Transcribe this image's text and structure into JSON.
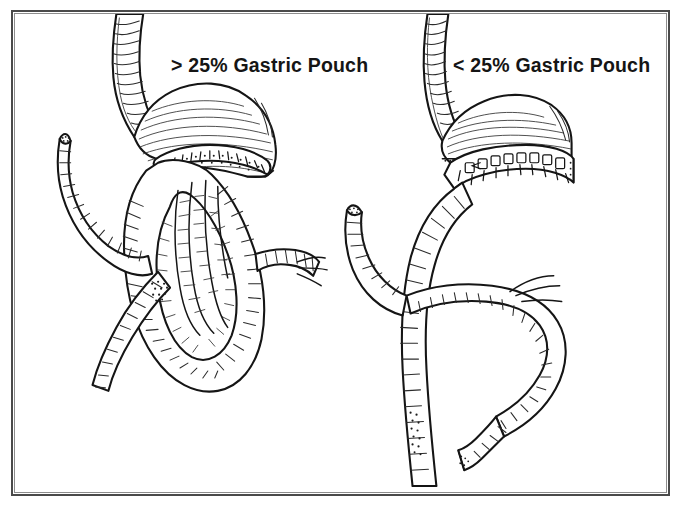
{
  "figure": {
    "kind": "medical-line-illustration",
    "background_color": "#ffffff",
    "ink_color": "#151515",
    "frame_color": "#4a4a4a"
  },
  "panels": [
    {
      "id": "left",
      "label": "> 25% Gastric Pouch",
      "comparator": ">",
      "percent": "25%",
      "structure_names": [
        "esophagus",
        "gastric-pouch-large",
        "staple-line",
        "gastrojejunal-anastomosis",
        "roux-limb-loop",
        "afferent-limb",
        "distal-bowel"
      ]
    },
    {
      "id": "right",
      "label": "< 25% Gastric Pouch",
      "comparator": "<",
      "percent": "25%",
      "structure_names": [
        "esophagus",
        "gastric-pouch-small",
        "staple-line",
        "gastrojejunal-anastomosis",
        "roux-limb",
        "afferent-limb",
        "distal-bowel",
        "jejunojejunostomy"
      ]
    }
  ]
}
